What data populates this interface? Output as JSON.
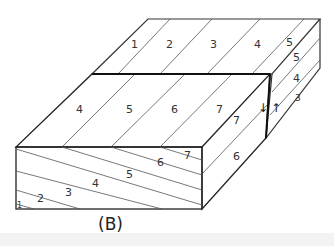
{
  "figure": {
    "caption": "(B)",
    "back_block": {
      "top_labels": [
        "1",
        "2",
        "3",
        "4",
        "5"
      ],
      "side_labels": [
        "5",
        "4",
        "3"
      ]
    },
    "front_block": {
      "top_labels": [
        "4",
        "5",
        "6",
        "7"
      ],
      "side_labels": [
        "7",
        "6"
      ],
      "front_labels": [
        "1",
        "2",
        "3",
        "4",
        "5",
        "6",
        "7"
      ]
    },
    "fault_arrows": {
      "down": "↓",
      "up": "↑"
    }
  }
}
